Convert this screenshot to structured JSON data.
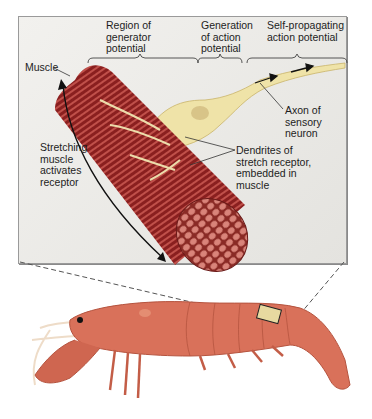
{
  "labels": {
    "region_generator": [
      "Region of",
      "generator",
      "potential"
    ],
    "generation_action": [
      "Generation",
      "of action",
      "potential"
    ],
    "self_propagating": [
      "Self-propagating",
      "action potential"
    ],
    "muscle": "Muscle",
    "stretching": [
      "Stretching",
      "muscle",
      "activates",
      "receptor"
    ],
    "axon": [
      "Axon of",
      "sensory",
      "neuron"
    ],
    "dendrites": [
      "Dendrites of",
      "stretch receptor,",
      "embedded in",
      "muscle"
    ]
  },
  "colors": {
    "muscle_dark": "#8a1f1f",
    "muscle_light": "#d98a7a",
    "neuron": "#efe3a8",
    "neuron_outline": "#c9b46a",
    "crayfish_body": "#d9715a",
    "crayfish_dark": "#b5543f",
    "panel_bg": "#ecebe7"
  }
}
